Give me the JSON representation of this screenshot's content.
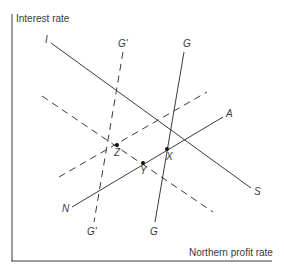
{
  "diagram": {
    "axes": {
      "y_label": "Interest rate",
      "x_label": "Northern profit rate"
    },
    "curves": [
      {
        "id": "IS",
        "start_label": "I",
        "end_label": "S",
        "style": "solid"
      },
      {
        "id": "GG",
        "start_label": "G",
        "end_label": "G",
        "style": "solid"
      },
      {
        "id": "G'G'",
        "start_label": "G'",
        "end_label": "G'",
        "style": "dashed"
      },
      {
        "id": "NA",
        "start_label": "N",
        "end_label": "A",
        "style": "solid"
      },
      {
        "id": "NA-shifted",
        "start_label": "",
        "end_label": "",
        "style": "dashed"
      },
      {
        "id": "IS-shifted",
        "start_label": "",
        "end_label": "",
        "style": "dashed"
      }
    ],
    "points": [
      {
        "label": "X"
      },
      {
        "label": "Y"
      },
      {
        "label": "Z"
      }
    ],
    "colors": {
      "line": "#3a3a3a",
      "background": "#ffffff"
    }
  }
}
